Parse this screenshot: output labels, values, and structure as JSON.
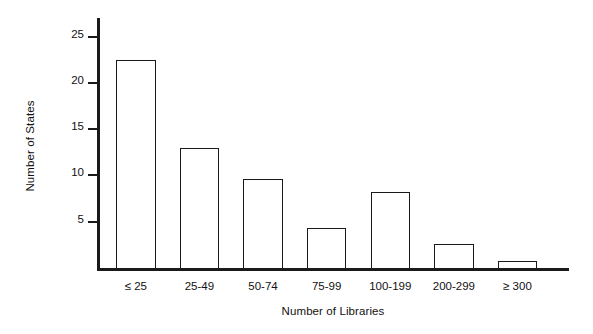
{
  "chart_data": {
    "type": "bar",
    "title": "",
    "subtitle": "",
    "xlabel": "Number of Libraries",
    "ylabel": "Number of States",
    "categories": [
      "≤ 25",
      "25-49",
      "50-74",
      "75-99",
      "100-199",
      "200-299",
      "≥ 300"
    ],
    "values": [
      22.5,
      13,
      9.6,
      4.3,
      8.2,
      2.6,
      0.8
    ],
    "series": [
      {
        "name": "Number of States",
        "values": [
          22.5,
          13,
          9.6,
          4.3,
          8.2,
          2.6,
          0.8
        ]
      }
    ],
    "ylim": [
      0,
      27
    ],
    "ytick_values": [
      5,
      10,
      15,
      20,
      25
    ],
    "ytick_labels": [
      "5",
      "10",
      "15",
      "20",
      "25"
    ],
    "grid": false,
    "legend": false,
    "legend_position": "none",
    "bar_fill_color": "#ffffff",
    "bar_edge_color": "#1a1a1a",
    "axis_color": "#1a1a1a",
    "background_color": "#ffffff",
    "annotations": []
  }
}
